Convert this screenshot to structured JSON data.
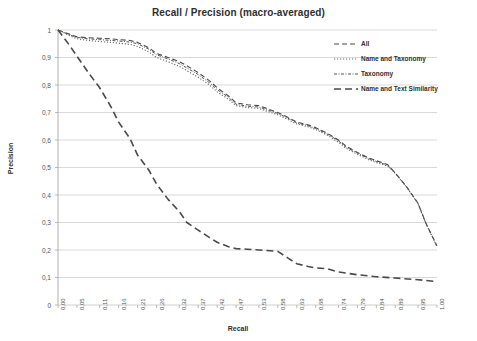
{
  "chart_data": {
    "type": "line",
    "title": "Recall / Precision (macro-averaged)",
    "xlabel": "Recall",
    "ylabel": "Precision",
    "xlim": [
      0,
      1
    ],
    "ylim": [
      0,
      1
    ],
    "grid": "horizontal",
    "legend_position": "top-right",
    "x_tick_labels": [
      "0,00",
      "0,05",
      "0,11",
      "0,16",
      "0,21",
      "0,26",
      "0,32",
      "0,37",
      "0,42",
      "0,47",
      "0,53",
      "0,58",
      "0,63",
      "0,68",
      "0,74",
      "0,79",
      "0,84",
      "0,89",
      "0,95",
      "1,00"
    ],
    "x_tick_values": [
      0.0,
      0.05,
      0.11,
      0.16,
      0.21,
      0.26,
      0.32,
      0.37,
      0.42,
      0.47,
      0.53,
      0.58,
      0.63,
      0.68,
      0.74,
      0.79,
      0.84,
      0.89,
      0.95,
      1.0
    ],
    "y_tick_labels": [
      "0",
      "0,1",
      "0,2",
      "0,3",
      "0,4",
      "0,5",
      "0,6",
      "0,7",
      "0,8",
      "0,9",
      "1"
    ],
    "y_tick_values": [
      0,
      0.1,
      0.2,
      0.3,
      0.4,
      0.5,
      0.6,
      0.7,
      0.8,
      0.9,
      1.0
    ],
    "series": [
      {
        "name": "All",
        "dash": "5,3",
        "color": "#4a4a4a",
        "width": 1.1,
        "x": [
          0.0,
          0.03,
          0.05,
          0.08,
          0.11,
          0.14,
          0.16,
          0.19,
          0.21,
          0.24,
          0.26,
          0.29,
          0.32,
          0.34,
          0.37,
          0.4,
          0.42,
          0.45,
          0.47,
          0.5,
          0.53,
          0.55,
          0.58,
          0.61,
          0.63,
          0.66,
          0.68,
          0.71,
          0.74,
          0.76,
          0.79,
          0.82,
          0.84,
          0.87,
          0.89,
          0.92,
          0.95,
          0.97,
          1.0
        ],
        "y": [
          1.0,
          0.985,
          0.975,
          0.972,
          0.97,
          0.968,
          0.965,
          0.962,
          0.955,
          0.935,
          0.915,
          0.9,
          0.885,
          0.87,
          0.845,
          0.815,
          0.79,
          0.76,
          0.735,
          0.728,
          0.725,
          0.715,
          0.7,
          0.68,
          0.665,
          0.655,
          0.645,
          0.625,
          0.6,
          0.578,
          0.555,
          0.535,
          0.525,
          0.51,
          0.48,
          0.43,
          0.37,
          0.3,
          0.215
        ]
      },
      {
        "name": "Name and Taxonomy",
        "dash": "1.2,1.8",
        "color": "#6a6a6a",
        "width": 1.1,
        "x": [
          0.0,
          0.03,
          0.05,
          0.08,
          0.11,
          0.14,
          0.16,
          0.19,
          0.21,
          0.24,
          0.26,
          0.29,
          0.32,
          0.34,
          0.37,
          0.4,
          0.42,
          0.45,
          0.47,
          0.5,
          0.53,
          0.55,
          0.58,
          0.61,
          0.63,
          0.66,
          0.68,
          0.71,
          0.74,
          0.76,
          0.79,
          0.82,
          0.84,
          0.87,
          0.89,
          0.92,
          0.95,
          0.97,
          1.0
        ],
        "y": [
          1.0,
          0.98,
          0.968,
          0.962,
          0.958,
          0.955,
          0.952,
          0.948,
          0.94,
          0.92,
          0.9,
          0.885,
          0.868,
          0.852,
          0.828,
          0.8,
          0.775,
          0.748,
          0.725,
          0.718,
          0.715,
          0.705,
          0.692,
          0.672,
          0.658,
          0.648,
          0.638,
          0.618,
          0.592,
          0.57,
          0.548,
          0.528,
          0.518,
          0.505,
          0.478,
          0.428,
          0.368,
          0.298,
          0.212
        ]
      },
      {
        "name": "Taxonomy",
        "dash": "3,1.5,1,1.5",
        "color": "#555555",
        "width": 1.0,
        "x": [
          0.0,
          0.03,
          0.05,
          0.08,
          0.11,
          0.14,
          0.16,
          0.19,
          0.21,
          0.24,
          0.26,
          0.29,
          0.32,
          0.34,
          0.37,
          0.4,
          0.42,
          0.45,
          0.47,
          0.5,
          0.53,
          0.55,
          0.58,
          0.61,
          0.63,
          0.66,
          0.68,
          0.71,
          0.74,
          0.76,
          0.79,
          0.82,
          0.84,
          0.87,
          0.89,
          0.92,
          0.95,
          0.97,
          1.0
        ],
        "y": [
          1.0,
          0.983,
          0.973,
          0.968,
          0.965,
          0.962,
          0.96,
          0.956,
          0.95,
          0.93,
          0.91,
          0.895,
          0.878,
          0.862,
          0.838,
          0.808,
          0.783,
          0.755,
          0.73,
          0.723,
          0.72,
          0.71,
          0.697,
          0.677,
          0.662,
          0.652,
          0.642,
          0.622,
          0.597,
          0.574,
          0.552,
          0.532,
          0.522,
          0.508,
          0.479,
          0.429,
          0.369,
          0.299,
          0.213
        ]
      },
      {
        "name": "Name and Text Similarity",
        "dash": "7,4",
        "color": "#4a4a4a",
        "width": 1.6,
        "x": [
          0.0,
          0.03,
          0.05,
          0.08,
          0.11,
          0.14,
          0.16,
          0.19,
          0.21,
          0.24,
          0.26,
          0.29,
          0.32,
          0.34,
          0.37,
          0.4,
          0.42,
          0.45,
          0.47,
          0.5,
          0.53,
          0.55,
          0.58,
          0.61,
          0.63,
          0.66,
          0.68,
          0.71,
          0.74,
          0.79,
          0.84,
          0.89,
          0.95,
          1.0
        ],
        "y": [
          1.0,
          0.945,
          0.905,
          0.845,
          0.79,
          0.72,
          0.665,
          0.605,
          0.545,
          0.49,
          0.44,
          0.385,
          0.34,
          0.3,
          0.272,
          0.245,
          0.228,
          0.212,
          0.205,
          0.203,
          0.2,
          0.198,
          0.195,
          0.168,
          0.15,
          0.14,
          0.135,
          0.132,
          0.12,
          0.11,
          0.103,
          0.098,
          0.092,
          0.085
        ]
      }
    ]
  }
}
